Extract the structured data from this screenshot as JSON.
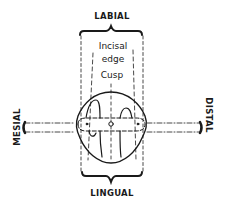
{
  "diagram": {
    "labels": {
      "top": "LABIAL",
      "bottom": "LINGUAL",
      "left": "MESIAL",
      "right": "DISTAL",
      "incisal_edge_line1": "Incisal",
      "incisal_edge_line2": "edge",
      "cusp": "Cusp"
    },
    "colors": {
      "ink": "#1a1a1a",
      "background": "#ffffff"
    }
  }
}
